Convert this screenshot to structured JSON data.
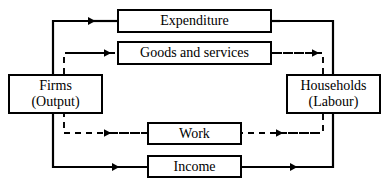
{
  "diagram": {
    "type": "circular-flow",
    "background_color": "#ffffff",
    "line_color": "#000000",
    "nodes": {
      "firms": {
        "line1": "Firms",
        "line2": "(Output)"
      },
      "households": {
        "line1": "Households",
        "line2": "(Labour)"
      },
      "expenditure": {
        "label": "Expenditure"
      },
      "goods": {
        "label": "Goods and services"
      },
      "work": {
        "label": "Work"
      },
      "income": {
        "label": "Income"
      }
    },
    "flows": [
      {
        "name": "expenditure-flow",
        "label": "Expenditure",
        "style": "solid",
        "direction": "households-to-firms",
        "arrow": "left"
      },
      {
        "name": "goods-and-services-flow",
        "label": "Goods and services",
        "style": "dashed",
        "direction": "firms-to-households",
        "arrow": "right"
      },
      {
        "name": "work-flow",
        "label": "Work",
        "style": "dashed",
        "direction": "households-to-firms",
        "arrow": "left"
      },
      {
        "name": "income-flow",
        "label": "Income",
        "style": "solid",
        "direction": "firms-to-households",
        "arrow": "right"
      }
    ]
  }
}
